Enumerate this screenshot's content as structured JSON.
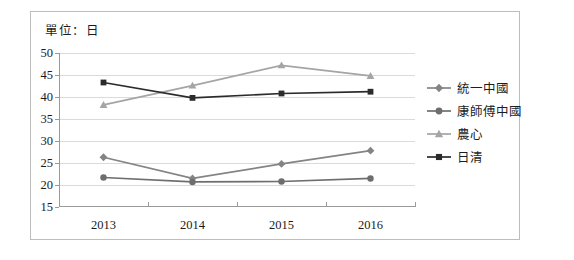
{
  "unit_label": "單位：日",
  "chart_data": {
    "type": "line",
    "title": "單位：日",
    "xlabel": "",
    "ylabel": "",
    "categories": [
      "2013",
      "2014",
      "2015",
      "2016"
    ],
    "x": [
      2013,
      2014,
      2015,
      2016
    ],
    "ylim": [
      15,
      50
    ],
    "yticks": [
      15,
      20,
      25,
      30,
      35,
      40,
      45,
      50
    ],
    "ytick_labels": [
      "15",
      "20",
      "25",
      "30",
      "35",
      "40",
      "45",
      "50"
    ],
    "grid": true,
    "legend_position": "right",
    "series": [
      {
        "name": "統一中國",
        "marker": "diamond",
        "color": "#848484",
        "values": [
          26.3,
          21.5,
          24.8,
          27.8
        ]
      },
      {
        "name": "康師傅中國",
        "marker": "circle",
        "color": "#6e6e6e",
        "values": [
          21.7,
          20.7,
          20.8,
          21.5
        ]
      },
      {
        "name": "農心",
        "marker": "triangle",
        "color": "#a5a5a5",
        "values": [
          38.2,
          42.6,
          47.2,
          44.8
        ]
      },
      {
        "name": "日清",
        "marker": "square",
        "color": "#2b2b2b",
        "values": [
          43.3,
          39.8,
          40.8,
          41.2
        ]
      }
    ]
  },
  "legend": {
    "items": [
      {
        "label": "統一中國",
        "marker": "diamond",
        "color": "#848484"
      },
      {
        "label": "康師傅中國",
        "marker": "circle",
        "color": "#6e6e6e"
      },
      {
        "label": "農心",
        "marker": "triangle",
        "color": "#a5a5a5"
      },
      {
        "label": "日清",
        "marker": "square",
        "color": "#2b2b2b"
      }
    ]
  }
}
